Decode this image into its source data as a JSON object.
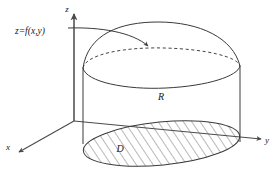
{
  "figure": {
    "type": "3d-solid-region-diagram",
    "axes": {
      "z_label": "z",
      "x_label": "x",
      "y_label": "y"
    },
    "labels": {
      "surface_equation": "z=f(x,y)",
      "solid_region": "R",
      "base_region": "D"
    },
    "colors": {
      "background": "#ffffff",
      "line": "#3a3a3a",
      "axis": "#4a4a4a",
      "hatch": "#5a5a5a",
      "text": "#1a1a1a"
    }
  }
}
